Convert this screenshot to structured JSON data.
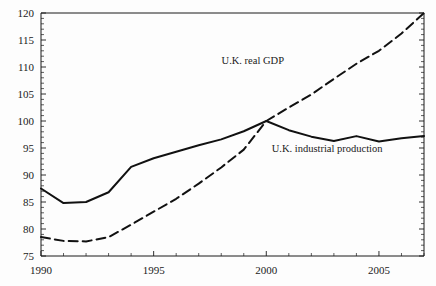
{
  "chart_data": {
    "type": "line",
    "title": "",
    "subtitle": "",
    "xlabel": "",
    "ylabel": "",
    "xlim": [
      1990,
      2007
    ],
    "ylim": [
      75,
      120
    ],
    "grid": false,
    "legend_position": "inline-annotations",
    "x_ticks_major": [
      1990,
      1995,
      2000,
      2005
    ],
    "x_tick_labels": [
      "1990",
      "1995",
      "2000",
      "2005"
    ],
    "x_ticks_minor": [
      1991,
      1992,
      1993,
      1994,
      1996,
      1997,
      1998,
      1999,
      2001,
      2002,
      2003,
      2004,
      2006,
      2007
    ],
    "y_ticks_major": [
      75,
      80,
      85,
      90,
      95,
      100,
      105,
      110,
      115,
      120
    ],
    "y_tick_labels": [
      "75",
      "80",
      "85",
      "90",
      "95",
      "100",
      "105",
      "110",
      "115",
      "120"
    ],
    "y_ticks_minor": [
      76,
      77,
      78,
      79,
      81,
      82,
      83,
      84,
      86,
      87,
      88,
      89,
      91,
      92,
      93,
      94,
      96,
      97,
      98,
      99,
      101,
      102,
      103,
      104,
      106,
      107,
      108,
      109,
      111,
      112,
      113,
      114,
      116,
      117,
      118,
      119
    ],
    "x": [
      1990,
      1991,
      1992,
      1993,
      1994,
      1995,
      1996,
      1997,
      1998,
      1999,
      2000,
      2001,
      2002,
      2003,
      2004,
      2005,
      2006,
      2007
    ],
    "series": [
      {
        "name": "U.K. real GDP",
        "label": "U.K. real GDP",
        "style": "dashed",
        "color": "#111111",
        "values": [
          78.5,
          77.8,
          77.7,
          78.5,
          80.8,
          83.2,
          85.6,
          88.4,
          91.4,
          94.7,
          100.0,
          102.5,
          104.9,
          107.8,
          110.6,
          113.0,
          116.2,
          120.0
        ]
      },
      {
        "name": "U.K. industrial production",
        "label": "U.K. industrial production",
        "style": "solid",
        "color": "#111111",
        "values": [
          87.5,
          84.8,
          85.0,
          86.8,
          91.5,
          93.1,
          94.3,
          95.5,
          96.6,
          98.1,
          100.0,
          98.3,
          97.1,
          96.3,
          97.2,
          96.2,
          96.8,
          97.2
        ]
      }
    ],
    "annotations": [
      {
        "text": "U.K. real GDP",
        "x": 1999.4,
        "y": 110.6,
        "anchor": "middle"
      },
      {
        "text": "U.K. industrial production",
        "x": 2002.7,
        "y": 94.3,
        "anchor": "middle"
      }
    ]
  },
  "axes": {
    "y_axis_name": "value-axis",
    "x_axis_name": "year-axis"
  }
}
